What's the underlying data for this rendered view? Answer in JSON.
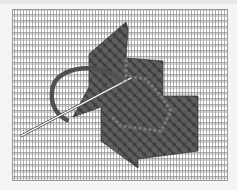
{
  "illustration": {
    "subject": "needlepoint diagonal stitch on canvas",
    "elements": [
      "canvas-mesh",
      "stitched-area",
      "yarn",
      "needle"
    ],
    "colors": {
      "background": "#f4f4f4",
      "canvas": "#ffffff",
      "mesh_line": "#9a9a9a",
      "stitch_fill": "#5a5a5a",
      "stitch_dark": "#3c3c3c",
      "stitch_light": "#7a7a7a",
      "yarn": "#505050",
      "needle": "#ffffff"
    }
  }
}
